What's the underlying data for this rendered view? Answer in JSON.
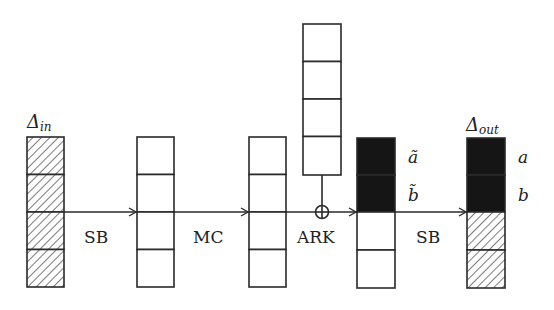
{
  "diagram": {
    "colors": {
      "stroke": "#2a2a2a",
      "active_fill": "#151515",
      "hatch": "#333333",
      "background": "#ffffff"
    },
    "states": [
      {
        "id": "delta-in",
        "label": "Δ",
        "subscript": "in",
        "cells": [
          "hatched",
          "hatched",
          "hatched",
          "hatched"
        ]
      },
      {
        "id": "after-sb",
        "cells": [
          "empty",
          "empty",
          "empty",
          "empty"
        ]
      },
      {
        "id": "after-mc",
        "cells": [
          "empty",
          "empty",
          "empty",
          "empty"
        ]
      },
      {
        "id": "round-key",
        "cells": [
          "empty",
          "empty",
          "empty",
          "empty"
        ]
      },
      {
        "id": "after-ark",
        "cells": [
          "black",
          "black",
          "empty",
          "empty"
        ],
        "side_labels": [
          "ã",
          "b̃"
        ]
      },
      {
        "id": "delta-out",
        "label": "Δ",
        "subscript": "out",
        "cells": [
          "black",
          "black",
          "hatched",
          "hatched"
        ],
        "side_labels": [
          "a",
          "b"
        ]
      }
    ],
    "operations": [
      {
        "id": "sb1",
        "label": "SB"
      },
      {
        "id": "mc",
        "label": "MC"
      },
      {
        "id": "ark",
        "label": "ARK"
      },
      {
        "id": "sb2",
        "label": "SB"
      }
    ],
    "symbols": {
      "xor": "⊕"
    }
  }
}
